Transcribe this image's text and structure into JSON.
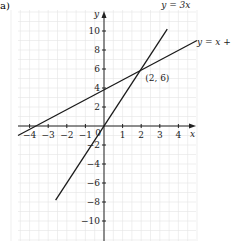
{
  "panel_label": "a)",
  "chart_data": {
    "type": "line",
    "title": "",
    "xlabel": "x",
    "ylabel": "y",
    "xlim": [
      -5,
      5
    ],
    "ylim": [
      -12,
      12
    ],
    "x_ticks": [
      -4,
      -3,
      -2,
      -1,
      1,
      2,
      3,
      4
    ],
    "y_ticks": [
      -10,
      -8,
      -6,
      -4,
      -2,
      2,
      4,
      6,
      8,
      10
    ],
    "origin_label": "0",
    "grid": true,
    "series": [
      {
        "name": "y = 3x",
        "label": "y = 3x",
        "slope": 3,
        "intercept": 0,
        "x": [
          -2.6,
          3.4
        ],
        "y": [
          -7.8,
          10.2
        ]
      },
      {
        "name": "y = x + 4",
        "label": "y = x +",
        "slope": 1,
        "intercept": 4,
        "x": [
          -5,
          5
        ],
        "y": [
          -1,
          9
        ]
      }
    ],
    "annotations": [
      {
        "text": "(2, 6)",
        "x": 2,
        "y": 6
      }
    ]
  },
  "colors": {
    "grid": "#e4e4e4",
    "axis": "#222222",
    "line": "#1a1a1a"
  }
}
